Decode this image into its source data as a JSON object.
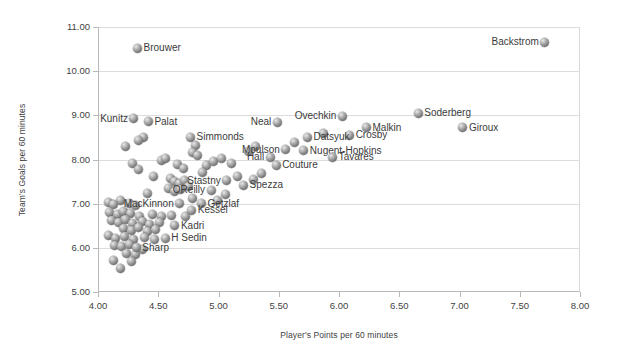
{
  "chart_data": {
    "type": "scatter",
    "title": "",
    "xlabel": "Player's Points per 60 minutes",
    "ylabel": "Team's Goals per 60 minutes",
    "xlim": [
      4.0,
      8.0
    ],
    "ylim": [
      5.0,
      11.0
    ],
    "xticks": [
      "4.00",
      "4.50",
      "5.00",
      "5.50",
      "6.00",
      "6.50",
      "7.00",
      "7.50",
      "8.00"
    ],
    "yticks": [
      "5.00",
      "6.00",
      "7.00",
      "8.00",
      "9.00",
      "10.00",
      "11.00"
    ],
    "grid": "horizontal",
    "legend": "none",
    "marker_color": "#8e8e8e",
    "labeled_points": [
      {
        "label": "Brouwer",
        "x": 4.32,
        "y": 10.52,
        "pos": "right"
      },
      {
        "label": "Backstrom",
        "x": 7.7,
        "y": 10.65,
        "pos": "left"
      },
      {
        "label": "Kunitz",
        "x": 4.29,
        "y": 8.92,
        "pos": "left"
      },
      {
        "label": "Palat",
        "x": 4.41,
        "y": 8.85,
        "pos": "right"
      },
      {
        "label": "Neal",
        "x": 5.48,
        "y": 8.84,
        "pos": "left"
      },
      {
        "label": "Ovechkin",
        "x": 6.02,
        "y": 8.98,
        "pos": "left"
      },
      {
        "label": "Soderberg",
        "x": 6.65,
        "y": 9.05,
        "pos": "right"
      },
      {
        "label": "Giroux",
        "x": 7.02,
        "y": 8.72,
        "pos": "right"
      },
      {
        "label": "Malkin",
        "x": 6.22,
        "y": 8.72,
        "pos": "right"
      },
      {
        "label": "Crosby",
        "x": 6.08,
        "y": 8.55,
        "pos": "right"
      },
      {
        "label": "Datsyuk",
        "x": 5.73,
        "y": 8.5,
        "pos": "right"
      },
      {
        "label": "Simmonds",
        "x": 4.76,
        "y": 8.5,
        "pos": "right"
      },
      {
        "label": "Moulson",
        "x": 5.55,
        "y": 8.22,
        "pos": "left"
      },
      {
        "label": "Nugent-Hopkins",
        "x": 5.7,
        "y": 8.2,
        "pos": "right"
      },
      {
        "label": "Hall",
        "x": 5.42,
        "y": 8.05,
        "pos": "left"
      },
      {
        "label": "Tavares",
        "x": 5.94,
        "y": 8.05,
        "pos": "right"
      },
      {
        "label": "Couture",
        "x": 5.47,
        "y": 7.87,
        "pos": "right"
      },
      {
        "label": "Stastny",
        "x": 5.06,
        "y": 7.52,
        "pos": "left"
      },
      {
        "label": "Spezza",
        "x": 5.2,
        "y": 7.42,
        "pos": "right"
      },
      {
        "label": "OReilly",
        "x": 4.93,
        "y": 7.3,
        "pos": "left"
      },
      {
        "label": "MacKinnon",
        "x": 4.67,
        "y": 7.0,
        "pos": "left"
      },
      {
        "label": "Getzlaf",
        "x": 4.85,
        "y": 7.0,
        "pos": "right"
      },
      {
        "label": "Kessel",
        "x": 4.77,
        "y": 6.85,
        "pos": "right"
      },
      {
        "label": "Kadri",
        "x": 4.63,
        "y": 6.5,
        "pos": "right"
      },
      {
        "label": "H Sedin",
        "x": 4.55,
        "y": 6.22,
        "pos": "right"
      },
      {
        "label": "Sharp",
        "x": 4.31,
        "y": 6.0,
        "pos": "right"
      }
    ],
    "unlabeled_points": [
      {
        "x": 4.37,
        "y": 8.5
      },
      {
        "x": 4.22,
        "y": 8.3
      },
      {
        "x": 4.33,
        "y": 8.44
      },
      {
        "x": 4.8,
        "y": 8.32
      },
      {
        "x": 4.78,
        "y": 8.15
      },
      {
        "x": 4.82,
        "y": 8.08
      },
      {
        "x": 4.52,
        "y": 7.98
      },
      {
        "x": 4.28,
        "y": 7.9
      },
      {
        "x": 4.33,
        "y": 7.78
      },
      {
        "x": 4.65,
        "y": 7.88
      },
      {
        "x": 4.7,
        "y": 7.8
      },
      {
        "x": 4.89,
        "y": 7.86
      },
      {
        "x": 4.45,
        "y": 7.62
      },
      {
        "x": 4.59,
        "y": 7.58
      },
      {
        "x": 4.63,
        "y": 7.5
      },
      {
        "x": 4.67,
        "y": 7.45
      },
      {
        "x": 4.71,
        "y": 7.52
      },
      {
        "x": 4.74,
        "y": 7.4
      },
      {
        "x": 4.58,
        "y": 7.35
      },
      {
        "x": 4.63,
        "y": 7.28
      },
      {
        "x": 4.68,
        "y": 7.33
      },
      {
        "x": 4.4,
        "y": 7.22
      },
      {
        "x": 4.18,
        "y": 7.08
      },
      {
        "x": 4.08,
        "y": 7.02
      },
      {
        "x": 4.12,
        "y": 6.98
      },
      {
        "x": 4.25,
        "y": 7.0
      },
      {
        "x": 4.3,
        "y": 6.95
      },
      {
        "x": 4.09,
        "y": 6.8
      },
      {
        "x": 4.15,
        "y": 6.76
      },
      {
        "x": 4.2,
        "y": 6.82
      },
      {
        "x": 4.26,
        "y": 6.78
      },
      {
        "x": 4.34,
        "y": 6.72
      },
      {
        "x": 4.44,
        "y": 6.76
      },
      {
        "x": 4.52,
        "y": 6.7
      },
      {
        "x": 4.6,
        "y": 6.74
      },
      {
        "x": 4.72,
        "y": 6.7
      },
      {
        "x": 4.1,
        "y": 6.62
      },
      {
        "x": 4.16,
        "y": 6.58
      },
      {
        "x": 4.22,
        "y": 6.64
      },
      {
        "x": 4.28,
        "y": 6.56
      },
      {
        "x": 4.36,
        "y": 6.6
      },
      {
        "x": 4.42,
        "y": 6.52
      },
      {
        "x": 4.5,
        "y": 6.58
      },
      {
        "x": 4.2,
        "y": 6.44
      },
      {
        "x": 4.27,
        "y": 6.4
      },
      {
        "x": 4.33,
        "y": 6.46
      },
      {
        "x": 4.4,
        "y": 6.38
      },
      {
        "x": 4.47,
        "y": 6.42
      },
      {
        "x": 4.08,
        "y": 6.28
      },
      {
        "x": 4.14,
        "y": 6.22
      },
      {
        "x": 4.21,
        "y": 6.26
      },
      {
        "x": 4.29,
        "y": 6.18
      },
      {
        "x": 4.38,
        "y": 6.24
      },
      {
        "x": 4.46,
        "y": 6.2
      },
      {
        "x": 4.13,
        "y": 6.06
      },
      {
        "x": 4.19,
        "y": 6.02
      },
      {
        "x": 4.25,
        "y": 6.08
      },
      {
        "x": 4.36,
        "y": 5.96
      },
      {
        "x": 4.23,
        "y": 5.88
      },
      {
        "x": 4.3,
        "y": 5.84
      },
      {
        "x": 4.12,
        "y": 5.72
      },
      {
        "x": 4.27,
        "y": 5.68
      },
      {
        "x": 4.18,
        "y": 5.54
      },
      {
        "x": 4.55,
        "y": 8.02
      },
      {
        "x": 4.95,
        "y": 7.95
      },
      {
        "x": 5.02,
        "y": 8.02
      },
      {
        "x": 5.1,
        "y": 7.9
      },
      {
        "x": 4.86,
        "y": 7.7
      },
      {
        "x": 5.15,
        "y": 7.62
      },
      {
        "x": 5.28,
        "y": 7.55
      },
      {
        "x": 5.35,
        "y": 7.68
      },
      {
        "x": 5.05,
        "y": 7.2
      },
      {
        "x": 4.78,
        "y": 7.12
      },
      {
        "x": 4.98,
        "y": 7.08
      },
      {
        "x": 5.24,
        "y": 8.18
      },
      {
        "x": 5.3,
        "y": 8.3
      },
      {
        "x": 5.62,
        "y": 8.38
      },
      {
        "x": 5.86,
        "y": 8.6
      }
    ]
  }
}
